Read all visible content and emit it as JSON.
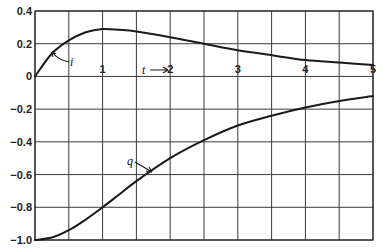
{
  "chart_data": {
    "type": "line",
    "title": "",
    "xlabel": "t",
    "ylabel": "",
    "xlim": [
      0,
      5
    ],
    "ylim": [
      -1.0,
      0.4
    ],
    "grid": true,
    "x_ticks": [
      0,
      0.5,
      1,
      1.5,
      2,
      2.5,
      3,
      3.5,
      4,
      4.5,
      5
    ],
    "x_tick_labels": [
      "1",
      "2",
      "3",
      "4",
      "5"
    ],
    "x_tick_label_values": [
      1,
      2,
      3,
      4,
      5
    ],
    "y_ticks": [
      0.4,
      0.2,
      0,
      -0.2,
      -0.4,
      -0.6,
      -0.8,
      -1.0
    ],
    "y_tick_labels": [
      "0.4",
      "0.2",
      "0",
      "-0.2",
      "-0.4",
      "-0.6",
      "-0.8",
      "-1.0"
    ],
    "annotations": [
      {
        "text": "i",
        "points_to_series": "i"
      },
      {
        "text": "q",
        "points_to_series": "q"
      },
      {
        "text": "t",
        "arrow": "→",
        "meaning": "time axis direction"
      }
    ],
    "x": [
      0,
      0.25,
      0.5,
      0.75,
      1,
      1.25,
      1.5,
      2,
      2.5,
      3,
      3.5,
      4,
      4.5,
      5
    ],
    "series": [
      {
        "name": "i",
        "values": [
          0,
          0.14,
          0.22,
          0.27,
          0.29,
          0.285,
          0.275,
          0.24,
          0.2,
          0.16,
          0.13,
          0.1,
          0.085,
          0.07
        ]
      },
      {
        "name": "q",
        "values": [
          -1.0,
          -0.985,
          -0.94,
          -0.875,
          -0.8,
          -0.72,
          -0.64,
          -0.5,
          -0.39,
          -0.3,
          -0.24,
          -0.19,
          -0.15,
          -0.12
        ]
      }
    ]
  }
}
